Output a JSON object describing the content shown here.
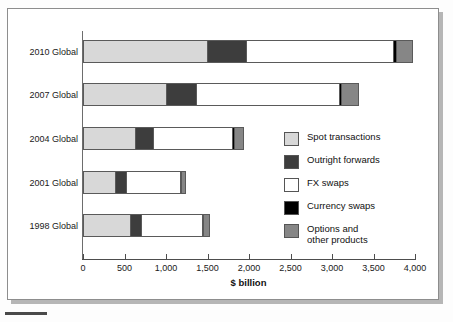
{
  "chart_data": {
    "type": "bar",
    "orientation": "horizontal",
    "stacked": true,
    "title": "",
    "xlabel": "$ billion",
    "ylabel": "",
    "xlim": [
      0,
      4000
    ],
    "xticks": [
      "0",
      "500",
      "1,000",
      "1,500",
      "2,000",
      "2,500",
      "3,000",
      "3,500",
      "4,000"
    ],
    "xtick_values": [
      0,
      500,
      1000,
      1500,
      2000,
      2500,
      3000,
      3500,
      4000
    ],
    "grid": false,
    "legend_position": "center-right",
    "categories": [
      "2010 Global",
      "2007 Global",
      "2004 Global",
      "2001 Global",
      "1998 Global"
    ],
    "series": [
      {
        "name": "Spot transactions",
        "color": "#d8d8d8",
        "values": [
          1490,
          1005,
          631,
          387,
          568
        ]
      },
      {
        "name": "Outright forwards",
        "color": "#3d3d3d",
        "values": [
          475,
          362,
          209,
          131,
          128
        ]
      },
      {
        "name": "FX swaps",
        "color": "#ffffff",
        "values": [
          1765,
          1714,
          954,
          656,
          734
        ]
      },
      {
        "name": "Currency swaps",
        "color": "#000000",
        "values": [
          43,
          31,
          21,
          7,
          10
        ]
      },
      {
        "name": "Options and\nother products",
        "color": "#868686",
        "values": [
          207,
          212,
          119,
          60,
          87
        ]
      }
    ],
    "totals": [
      3980,
      3324,
      1934,
      1241,
      1527
    ]
  },
  "legend": {
    "items": [
      {
        "label": "Spot transactions",
        "color": "#d8d8d8"
      },
      {
        "label": "Outright forwards",
        "color": "#3d3d3d"
      },
      {
        "label": "FX swaps",
        "color": "#ffffff"
      },
      {
        "label": " Currency swaps",
        "color": "#000000"
      },
      {
        "label": "Options and\nother products",
        "color": "#868686"
      }
    ]
  }
}
